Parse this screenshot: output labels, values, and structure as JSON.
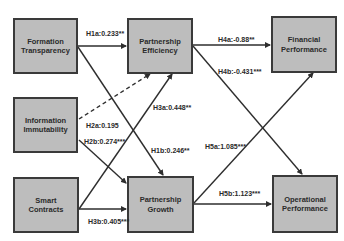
{
  "diagram": {
    "type": "path-model",
    "nodes": [
      {
        "id": "formation_transparency",
        "label": "Formation Transparency",
        "x": 13,
        "y": 18,
        "w": 65,
        "h": 56
      },
      {
        "id": "information_immutability",
        "label": "Information Immutability",
        "x": 13,
        "y": 97,
        "w": 65,
        "h": 56
      },
      {
        "id": "smart_contracts",
        "label": "Smart Contracts",
        "x": 13,
        "y": 177,
        "w": 66,
        "h": 56
      },
      {
        "id": "partnership_efficiency",
        "label": "Partnership Efficiency",
        "x": 127,
        "y": 18,
        "w": 66,
        "h": 56
      },
      {
        "id": "partnership_growth",
        "label": "Partnership Growth",
        "x": 127,
        "y": 176,
        "w": 67,
        "h": 57
      },
      {
        "id": "financial_performance",
        "label": "Financial Performance",
        "x": 271,
        "y": 16,
        "w": 66,
        "h": 57
      },
      {
        "id": "operational_performance",
        "label": "Operational Performance",
        "x": 272,
        "y": 175,
        "w": 66,
        "h": 58
      }
    ],
    "edges": [
      {
        "id": "H1a",
        "from": "formation_transparency",
        "to": "partnership_efficiency",
        "label": "H1a:0.233**",
        "style": "solid"
      },
      {
        "id": "H1b",
        "from": "formation_transparency",
        "to": "partnership_growth",
        "label": "H1b:0.246**",
        "style": "solid"
      },
      {
        "id": "H2a",
        "from": "information_immutability",
        "to": "partnership_efficiency",
        "label": "H2a:0.195",
        "style": "dashed"
      },
      {
        "id": "H2b",
        "from": "information_immutability",
        "to": "partnership_growth",
        "label": "H2b:0.274***",
        "style": "solid"
      },
      {
        "id": "H3a",
        "from": "smart_contracts",
        "to": "partnership_efficiency",
        "label": "H3a:0.448**",
        "style": "solid"
      },
      {
        "id": "H3b",
        "from": "smart_contracts",
        "to": "partnership_growth",
        "label": "H3b:0.405***",
        "style": "solid"
      },
      {
        "id": "H4a",
        "from": "partnership_efficiency",
        "to": "financial_performance",
        "label": "H4a:-0.88**",
        "style": "solid"
      },
      {
        "id": "H4b",
        "from": "partnership_efficiency",
        "to": "operational_performance",
        "label": "H4b:-0.431***",
        "style": "solid"
      },
      {
        "id": "H5a",
        "from": "partnership_growth",
        "to": "financial_performance",
        "label": "H5a:1.085***",
        "style": "solid"
      },
      {
        "id": "H5b",
        "from": "partnership_growth",
        "to": "operational_performance",
        "label": "H5b:1.123***",
        "style": "solid"
      }
    ],
    "colors": {
      "node_fill": "#bdbdbd",
      "node_border": "#3a3a3a",
      "edge": "#2e2e2e",
      "text": "#2a2a2a",
      "background": "#ffffff"
    }
  },
  "labels": {
    "h1a": "H1a:0.233**",
    "h1b": "H1b:0.246**",
    "h2a": "H2a:0.195",
    "h2b": "H2b:0.274***",
    "h3a": "H3a:0.448**",
    "h3b": "H3b:0.405***",
    "h4a": "H4a:-0.88**",
    "h4b": "H4b:-0.431***",
    "h5a": "H5a:1.085***",
    "h5b": "H5b:1.123***"
  },
  "nodes": {
    "formation_transparency": "Formation Transparency",
    "information_immutability": "Information Immutability",
    "smart_contracts": "Smart Contracts",
    "partnership_efficiency": "Partnership Efficiency",
    "partnership_growth": "Partnership Growth",
    "financial_performance": "Financial Performance",
    "operational_performance": "Operational Performance"
  }
}
